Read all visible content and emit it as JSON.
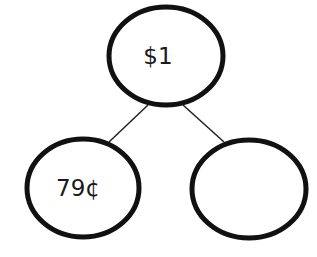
{
  "diagram": {
    "type": "number-bond",
    "whole": {
      "label": "$1"
    },
    "parts": [
      {
        "label": "79¢"
      },
      {
        "label": ""
      }
    ],
    "colors": {
      "stroke": "#111111",
      "background": "#ffffff",
      "text": "#1a1a1a"
    }
  }
}
